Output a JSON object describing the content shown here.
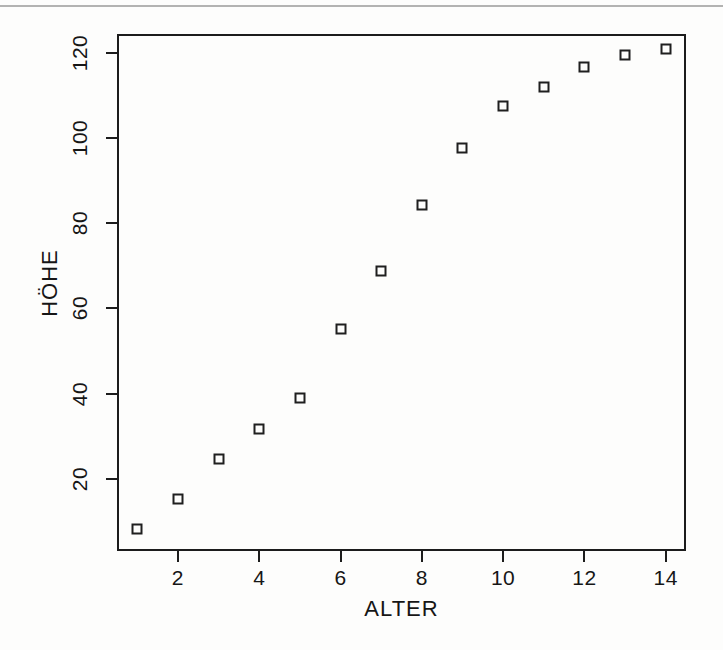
{
  "figure": {
    "background_color": "#fdfdfc",
    "ink_color": "#1c1c1c",
    "scan_artifact_line": true
  },
  "chart_data": {
    "type": "scatter",
    "title": "",
    "xlabel": "ALTER",
    "ylabel": "HÖHE",
    "x": [
      1,
      2,
      3,
      4,
      5,
      6,
      7,
      8,
      9,
      10,
      11,
      12,
      13,
      14
    ],
    "values": [
      8.2,
      15.3,
      24.7,
      31.6,
      38.9,
      55.2,
      68.8,
      84.4,
      97.8,
      107.5,
      112.0,
      116.8,
      119.6,
      121.0
    ],
    "points": [
      {
        "x": 1,
        "y": 8.2
      },
      {
        "x": 2,
        "y": 15.3
      },
      {
        "x": 3,
        "y": 24.7
      },
      {
        "x": 4,
        "y": 31.6
      },
      {
        "x": 5,
        "y": 38.9
      },
      {
        "x": 6,
        "y": 55.2
      },
      {
        "x": 7,
        "y": 68.8
      },
      {
        "x": 8,
        "y": 84.4
      },
      {
        "x": 9,
        "y": 97.8
      },
      {
        "x": 10,
        "y": 107.5
      },
      {
        "x": 11,
        "y": 112.0
      },
      {
        "x": 12,
        "y": 116.8
      },
      {
        "x": 13,
        "y": 119.6
      },
      {
        "x": 14,
        "y": 121.0
      }
    ],
    "xlim": [
      0.5,
      14.5
    ],
    "ylim": [
      3.0,
      124.5
    ],
    "xticks": [
      2,
      4,
      6,
      8,
      10,
      12,
      14
    ],
    "yticks": [
      20,
      40,
      60,
      80,
      100,
      120
    ],
    "xtick_labels": [
      "2",
      "4",
      "6",
      "8",
      "10",
      "12",
      "14"
    ],
    "ytick_labels": [
      "20",
      "40",
      "60",
      "80",
      "100",
      "120"
    ],
    "grid": false,
    "legend": null,
    "marker": "open-square",
    "marker_color": "#1f1f1f"
  }
}
